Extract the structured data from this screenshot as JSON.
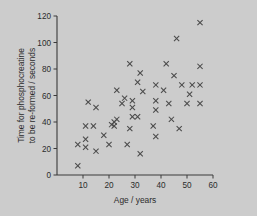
{
  "chart_data": {
    "type": "scatter",
    "title": "",
    "xlabel": "Age / years",
    "ylabel": "Time for phosphocreatine to be re-formed / seconds",
    "ylabel_line1": "Time for phosphocreatine",
    "ylabel_line2": "to be re-formed / seconds",
    "xlim": [
      0,
      60
    ],
    "ylim": [
      0,
      120
    ],
    "xticks": [
      10,
      20,
      30,
      40,
      50,
      60
    ],
    "xtick_labels": [
      "10",
      "20",
      "30",
      "40",
      "50",
      "60"
    ],
    "yticks": [
      0,
      20,
      40,
      60,
      80,
      100,
      120
    ],
    "ytick_labels": [
      "0",
      "20",
      "40",
      "60",
      "80",
      "100",
      "120"
    ],
    "grid": false,
    "legend": false,
    "marker": "x",
    "marker_color": "#4a4a4a",
    "axis_color": "#3a3a3a",
    "background_color": "#cccccc",
    "n_points": 57,
    "points": [
      [
        8,
        7
      ],
      [
        8,
        23
      ],
      [
        11,
        21
      ],
      [
        11,
        27
      ],
      [
        11,
        37
      ],
      [
        12,
        55
      ],
      [
        14,
        37
      ],
      [
        15,
        18
      ],
      [
        15,
        51
      ],
      [
        18,
        30
      ],
      [
        20,
        23
      ],
      [
        21,
        38
      ],
      [
        22,
        40
      ],
      [
        22,
        37
      ],
      [
        23,
        42
      ],
      [
        23,
        64
      ],
      [
        25,
        54
      ],
      [
        26,
        58
      ],
      [
        27,
        23
      ],
      [
        28,
        35
      ],
      [
        28,
        84
      ],
      [
        29,
        44
      ],
      [
        29,
        51
      ],
      [
        29,
        56
      ],
      [
        31,
        44
      ],
      [
        31,
        70
      ],
      [
        32,
        16
      ],
      [
        32,
        77
      ],
      [
        33,
        63
      ],
      [
        37,
        37
      ],
      [
        38,
        29
      ],
      [
        38,
        49
      ],
      [
        38,
        56
      ],
      [
        38,
        68
      ],
      [
        41,
        64
      ],
      [
        42,
        84
      ],
      [
        43,
        54
      ],
      [
        44,
        42
      ],
      [
        45,
        75
      ],
      [
        46,
        103
      ],
      [
        47,
        35
      ],
      [
        48,
        68
      ],
      [
        50,
        54
      ],
      [
        51,
        61
      ],
      [
        52,
        68
      ],
      [
        55,
        54
      ],
      [
        55,
        68
      ],
      [
        55,
        82
      ],
      [
        55,
        115
      ]
    ]
  }
}
